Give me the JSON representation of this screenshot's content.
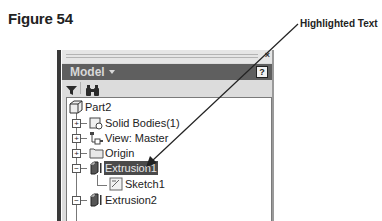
{
  "figure": {
    "title": "Figure 54"
  },
  "callout": {
    "label": "Highlighted Text",
    "target": "Extrusion1"
  },
  "panel": {
    "close_label": "×",
    "title": "Model",
    "help_label": "?",
    "toolbar": [
      {
        "icon": "filter-icon"
      },
      {
        "icon": "binoculars-icon"
      }
    ]
  },
  "tree": {
    "root": "Part2",
    "items": [
      {
        "label": "Solid Bodies(1)",
        "icon": "solid-bodies-icon",
        "expander": "+",
        "highlighted": false
      },
      {
        "label": "View: Master",
        "icon": "view-icon",
        "expander": "+",
        "highlighted": false
      },
      {
        "label": "Origin",
        "icon": "folder-icon",
        "expander": "+",
        "highlighted": false
      },
      {
        "label": "Extrusion1",
        "icon": "extrusion-icon",
        "expander": "−",
        "highlighted": true
      },
      {
        "label": "Sketch1",
        "icon": "sketch-icon",
        "expander": "",
        "highlighted": false,
        "child": true
      },
      {
        "label": "Extrusion2",
        "icon": "extrusion-icon",
        "expander": "−",
        "highlighted": false
      }
    ]
  },
  "colors": {
    "title_bar": "#5f5f5f",
    "highlight": "#4a4a4a",
    "panel_bg": "#dcdcdc"
  }
}
